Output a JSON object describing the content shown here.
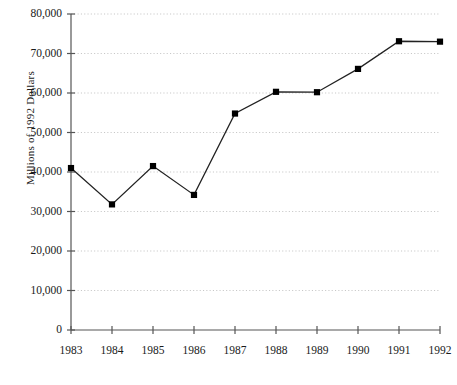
{
  "chart_data": {
    "type": "line",
    "title": "",
    "subtitle": "",
    "xlabel": "",
    "ylabel": "Millions of 1992 Dollars",
    "categories": [
      "1983",
      "1984",
      "1985",
      "1986",
      "1987",
      "1988",
      "1989",
      "1990",
      "1991",
      "1992"
    ],
    "x": [
      1983,
      1984,
      1985,
      1986,
      1987,
      1988,
      1989,
      1990,
      1991,
      1992
    ],
    "values": [
      41000,
      31800,
      41500,
      34200,
      54800,
      60300,
      60200,
      66100,
      73100,
      73000
    ],
    "series": [
      {
        "name": "Millions of 1992 Dollars",
        "values": [
          41000,
          31800,
          41500,
          34200,
          54800,
          60300,
          60200,
          66100,
          73100,
          73000
        ]
      }
    ],
    "ylim": [
      0,
      80000
    ],
    "xlim": [
      1983,
      1992
    ],
    "ytick_labels": [
      "0",
      "10,000",
      "20,000",
      "30,000",
      "40,000",
      "50,000",
      "60,000",
      "70,000",
      "80,000"
    ],
    "ytick_values": [
      0,
      10000,
      20000,
      30000,
      40000,
      50000,
      60000,
      70000,
      80000
    ],
    "xtick_labels": [
      "1983",
      "1984",
      "1985",
      "1986",
      "1987",
      "1988",
      "1989",
      "1990",
      "1991",
      "1992"
    ],
    "grid": "horizontal-dotted",
    "legend": "none",
    "marker": "square",
    "line_color": "#222222",
    "marker_color": "#000000",
    "grid_color": "#b9b9b9",
    "axis_color": "#555555",
    "background_color": "#ffffff"
  }
}
